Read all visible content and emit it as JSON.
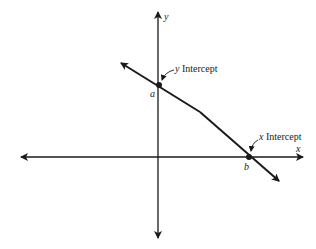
{
  "diagram": {
    "axes": {
      "x_label": "x",
      "y_label": "y"
    },
    "line": {
      "y_intercept_point_label": "a",
      "x_intercept_point_label": "b",
      "y_intercept_callout_var": "y",
      "y_intercept_callout_text": "Intercept",
      "x_intercept_callout_var": "x",
      "x_intercept_callout_text": "Intercept"
    },
    "colors": {
      "stroke": "#1a1a1a",
      "background": "#ffffff"
    }
  }
}
